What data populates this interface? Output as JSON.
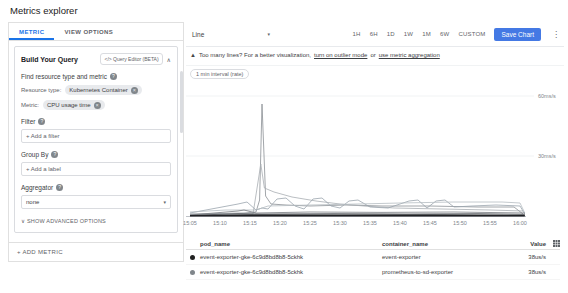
{
  "page_title": "Metrics explorer",
  "left_panel": {
    "tabs": [
      {
        "label": "METRIC",
        "active": true
      },
      {
        "label": "VIEW OPTIONS",
        "active": false
      }
    ],
    "query_card": {
      "title": "Build Your Query",
      "query_editor_icon": "</>",
      "query_editor_label": "Query Editor (BETA)",
      "collapse_icon": "chevron-up",
      "find_label": "Find resource type and metric",
      "resource_type_label": "Resource type:",
      "resource_type_chip": "Kubernetes Container",
      "metric_label": "Metric:",
      "metric_chip": "CPU usage time",
      "filter_label": "Filter",
      "add_filter_label": "+ Add a filter",
      "group_by_label": "Group By",
      "add_label_label": "+ Add a label",
      "aggregator_label": "Aggregator",
      "aggregator_value": "none",
      "advanced_options_label": "SHOW ADVANCED OPTIONS"
    },
    "add_metric_label": "+ ADD METRIC"
  },
  "toolbar": {
    "chart_type_value": "Line",
    "time_ranges": [
      "1H",
      "6H",
      "1D",
      "1W",
      "1M",
      "6W",
      "CUSTOM"
    ],
    "save_chart_label": "Save Chart"
  },
  "warning": {
    "prefix": "Too many lines? For a better visualization,",
    "link_outlier": "turn on outlier mode",
    "conjunction": "or",
    "link_aggregation": "use metric aggregation"
  },
  "chart": {
    "interval_badge": "1 min interval (rate)"
  },
  "chart_data": {
    "type": "line",
    "y_unit": "ms/s",
    "ylim": [
      0,
      66
    ],
    "y_ticks": [
      {
        "label": "60ms/s",
        "value": 60
      },
      {
        "label": "30ms/s",
        "value": 30
      }
    ],
    "x_ticks": [
      "15:05",
      "15:10",
      "15:15",
      "15:20",
      "15:25",
      "15:30",
      "15:35",
      "15:40",
      "15:45",
      "15:50",
      "15:55",
      "16:00"
    ],
    "x_range_minutes": [
      0,
      56
    ],
    "grid": true,
    "legend_position": "table-below",
    "series": [
      {
        "name": "spike-line",
        "color": "#8a8f94",
        "width": 0.8,
        "points": [
          [
            0,
            1
          ],
          [
            9,
            1.5
          ],
          [
            11,
            2
          ],
          [
            11.6,
            8
          ],
          [
            12,
            56
          ],
          [
            12.6,
            10
          ],
          [
            13.5,
            6
          ],
          [
            16,
            5.5
          ],
          [
            20,
            5
          ],
          [
            26,
            5.5
          ],
          [
            32,
            5
          ],
          [
            40,
            5
          ],
          [
            48,
            4.5
          ],
          [
            54,
            4.5
          ],
          [
            55.5,
            1
          ]
        ]
      },
      {
        "name": "decay-line",
        "color": "#a8adb2",
        "width": 0.8,
        "points": [
          [
            0,
            0.8
          ],
          [
            10.5,
            1
          ],
          [
            11.8,
            26
          ],
          [
            12.4,
            14
          ],
          [
            14,
            12
          ],
          [
            17,
            9.5
          ],
          [
            21,
            7.5
          ],
          [
            25,
            6
          ],
          [
            29,
            5
          ],
          [
            34,
            4
          ],
          [
            42,
            3.5
          ],
          [
            50,
            3
          ],
          [
            55.5,
            2.5
          ]
        ]
      },
      {
        "name": "wavy-line",
        "color": "#9aa4ad",
        "width": 0.8,
        "points": [
          [
            0,
            1.5
          ],
          [
            8,
            6
          ],
          [
            9.5,
            7
          ],
          [
            11,
            3
          ],
          [
            12,
            4
          ],
          [
            13,
            3.5
          ],
          [
            14.5,
            8.5
          ],
          [
            16,
            9
          ],
          [
            17.5,
            5
          ],
          [
            19,
            3.5
          ],
          [
            20.5,
            8.5
          ],
          [
            22,
            9
          ],
          [
            23.5,
            5
          ],
          [
            25,
            4
          ],
          [
            26.5,
            7.5
          ],
          [
            28,
            8
          ],
          [
            30,
            4.5
          ],
          [
            33,
            4
          ],
          [
            36.5,
            7.5
          ],
          [
            38,
            8
          ],
          [
            39.5,
            4
          ],
          [
            41,
            7.5
          ],
          [
            42.5,
            8
          ],
          [
            44,
            4.5
          ],
          [
            47,
            5
          ],
          [
            51,
            5.5
          ],
          [
            55,
            5
          ],
          [
            55.8,
            1
          ]
        ]
      },
      {
        "name": "plateau-line",
        "color": "#b5bcc2",
        "width": 0.8,
        "points": [
          [
            0,
            2
          ],
          [
            6,
            3
          ],
          [
            11,
            3
          ],
          [
            13,
            5
          ],
          [
            20,
            5.5
          ],
          [
            28,
            6
          ],
          [
            35,
            6.5
          ],
          [
            44,
            7
          ],
          [
            52,
            7
          ],
          [
            55,
            6.5
          ],
          [
            55.8,
            1.5
          ]
        ]
      },
      {
        "name": "low-line-1",
        "color": "#777b80",
        "width": 0.8,
        "points": [
          [
            0,
            0.5
          ],
          [
            8,
            2.5
          ],
          [
            9,
            3
          ],
          [
            11,
            1.5
          ],
          [
            20,
            2
          ],
          [
            32,
            1.8
          ],
          [
            44,
            2
          ],
          [
            55.8,
            1.5
          ]
        ]
      },
      {
        "name": "low-line-2",
        "color": "#55595e",
        "width": 0.8,
        "points": [
          [
            0,
            0.3
          ],
          [
            8,
            1.2
          ],
          [
            12,
            1
          ],
          [
            24,
            1.2
          ],
          [
            36,
            1
          ],
          [
            48,
            1.2
          ],
          [
            55.8,
            0.8
          ]
        ]
      },
      {
        "name": "low-line-3",
        "color": "#3c4043",
        "width": 1,
        "points": [
          [
            0,
            0.2
          ],
          [
            10,
            0.6
          ],
          [
            25,
            0.5
          ],
          [
            40,
            0.6
          ],
          [
            55.8,
            0.4
          ]
        ]
      },
      {
        "name": "baseline-band",
        "color": "#202124",
        "width": 1.6,
        "points": [
          [
            0,
            0.1
          ],
          [
            14,
            0.2
          ],
          [
            28,
            0.2
          ],
          [
            42,
            0.2
          ],
          [
            55.8,
            0.15
          ]
        ]
      }
    ]
  },
  "table": {
    "headers": {
      "pod": "pod_name",
      "container": "container_name",
      "value": "Value"
    },
    "rows": [
      {
        "dot_color": "#212121",
        "pod_name": "event-exporter-gke-6c9d8bd8b8-5ckhk",
        "container_name": "event-exporter",
        "value": "38us/s"
      },
      {
        "dot_color": "#80868b",
        "pod_name": "event-exporter-gke-6c9d8bd8b8-5ckhk",
        "container_name": "prometheus-to-sd-exporter",
        "value": "38us/s"
      }
    ]
  },
  "colors": {
    "accent": "#1a73e8",
    "save_button": "#4479e4",
    "chip_bg": "#e8eaed",
    "border": "#e0e0e0",
    "text_secondary": "#5f6368"
  }
}
